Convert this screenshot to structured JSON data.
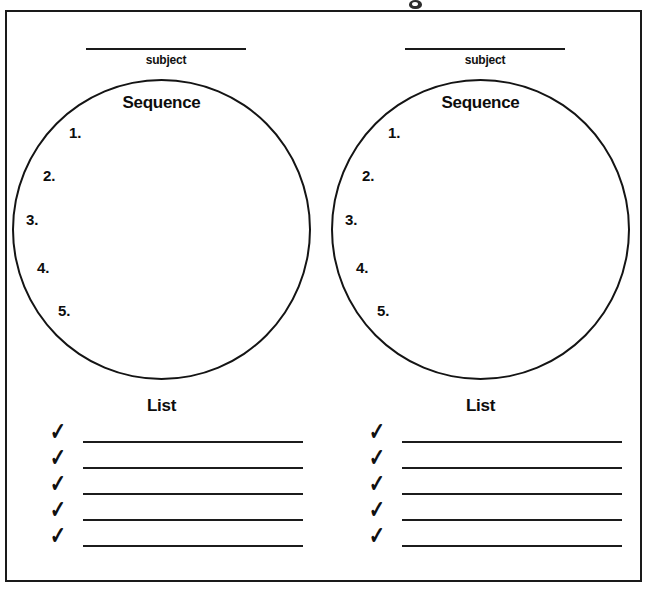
{
  "worksheet": {
    "type": "graphic-organizer",
    "panel_count": 2,
    "artifact_note": "",
    "panels": [
      {
        "id": "left",
        "subject_label": "subject",
        "subject_value": "",
        "circle_heading": "Sequence",
        "steps": [
          {
            "number": "1."
          },
          {
            "number": "2."
          },
          {
            "number": "3."
          },
          {
            "number": "4."
          },
          {
            "number": "5."
          }
        ],
        "list_heading": "List",
        "checklist": [
          {
            "mark": "✓",
            "value": ""
          },
          {
            "mark": "✓",
            "value": ""
          },
          {
            "mark": "✓",
            "value": ""
          },
          {
            "mark": "✓",
            "value": ""
          },
          {
            "mark": "✓",
            "value": ""
          }
        ]
      },
      {
        "id": "right",
        "subject_label": "subject",
        "subject_value": "",
        "circle_heading": "Sequence",
        "steps": [
          {
            "number": "1."
          },
          {
            "number": "2."
          },
          {
            "number": "3."
          },
          {
            "number": "4."
          },
          {
            "number": "5."
          }
        ],
        "list_heading": "List",
        "checklist": [
          {
            "mark": "✓",
            "value": ""
          },
          {
            "mark": "✓",
            "value": ""
          },
          {
            "mark": "✓",
            "value": ""
          },
          {
            "mark": "✓",
            "value": ""
          },
          {
            "mark": "✓",
            "value": ""
          }
        ]
      }
    ]
  },
  "colors": {
    "ink": "#1a1a1a",
    "paper": "#ffffff"
  }
}
